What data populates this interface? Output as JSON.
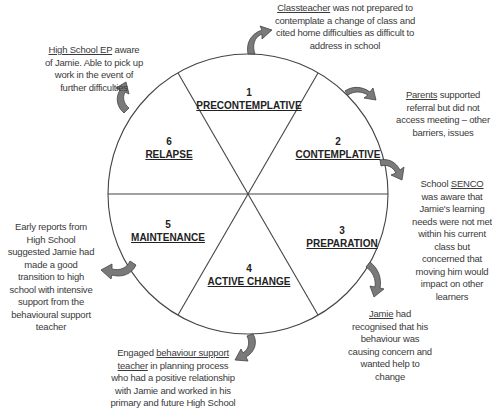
{
  "stages": [
    {
      "number": "1",
      "name": "PRECONTEMPLATIVE"
    },
    {
      "number": "2",
      "name": "CONTEMPLATIVE"
    },
    {
      "number": "3",
      "name": "PREPARATION"
    },
    {
      "number": "4",
      "name": "ACTIVE CHANGE"
    },
    {
      "number": "5",
      "name": "MAINTENANCE"
    },
    {
      "number": "6",
      "name": "RELAPSE"
    }
  ],
  "notes": {
    "classteacher": {
      "subject": "Classteacher",
      "text": " was not prepared to contemplate a change of class and cited home difficulties as difficult to address in school"
    },
    "parents": {
      "subject": "Parents",
      "text": " supported referral but did not access meeting – other barriers, issues"
    },
    "senco": {
      "prefix": "School ",
      "subject": "SENCO",
      "text": " was aware that Jamie's learning needs were not met within his current class but concerned that moving him would impact on other learners"
    },
    "jamie": {
      "subject": "Jamie",
      "text": " had recognised that his behaviour was causing concern and wanted help to change"
    },
    "behaviour_teacher": {
      "prefix": "Engaged ",
      "subject": "behaviour support teacher",
      "text": " in planning process who had a positive relationship with Jamie and worked in his primary and future High School"
    },
    "early_reports": {
      "text": "Early reports from High School suggested Jamie had made a good transition to high school with intensive support from the behavioural support teacher"
    },
    "high_school_ep": {
      "subject": "High School EP",
      "text": " aware of Jamie. Able to pick up work in the event of further difficulties"
    }
  },
  "colors": {
    "line": "#444444",
    "arrow_fill": "#7a7a7a",
    "arrow_stroke": "#444444",
    "text": "#333333"
  }
}
